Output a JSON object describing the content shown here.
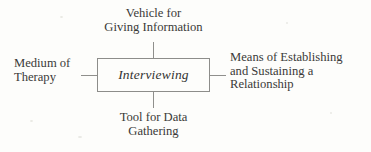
{
  "diagram": {
    "type": "hub-and-spoke",
    "center": {
      "label": "Interviewing",
      "style": "italic"
    },
    "nodes": [
      {
        "position": "top",
        "lines": [
          "Vehicle for",
          "Giving Information"
        ]
      },
      {
        "position": "right",
        "lines": [
          "Means of Establishing",
          "and Sustaining a",
          "Relationship"
        ]
      },
      {
        "position": "bottom",
        "lines": [
          "Tool for Data",
          "Gathering"
        ]
      },
      {
        "position": "left",
        "lines": [
          "Medium of",
          "Therapy"
        ]
      }
    ],
    "colors": {
      "background": "#fdfdfb",
      "text": "#3a3a38",
      "line": "#8f8f8c",
      "box_border": "#8d8d8a"
    }
  }
}
